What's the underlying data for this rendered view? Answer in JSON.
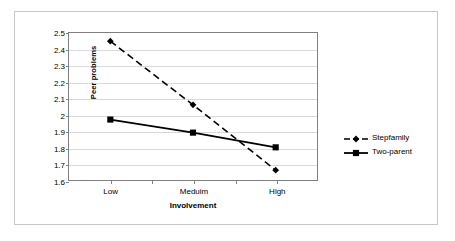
{
  "chart_data": {
    "type": "line",
    "title": "",
    "xlabel": "Involvement",
    "ylabel": "Peer problems",
    "categories": [
      "Low",
      "Meduim",
      "High"
    ],
    "ylim": [
      1.6,
      2.5
    ],
    "y_ticks": [
      "2.5",
      "2.4",
      "2.3",
      "2.2",
      "2.1",
      "2",
      "1.9",
      "1.8",
      "1.7",
      "1.6"
    ],
    "y_tick_values": [
      2.5,
      2.4,
      2.3,
      2.2,
      2.1,
      2.0,
      1.9,
      1.8,
      1.7,
      1.6
    ],
    "grid": true,
    "legend_position": "right",
    "series": [
      {
        "name": "Stepfamily",
        "values": [
          2.45,
          2.06,
          1.66
        ],
        "marker": "diamond",
        "line_style": "dashed",
        "color": "#000000"
      },
      {
        "name": "Two-parent",
        "values": [
          1.97,
          1.89,
          1.8
        ],
        "marker": "square",
        "line_style": "solid",
        "color": "#000000"
      }
    ]
  },
  "legend": {
    "items": [
      {
        "label": "Stepfamily",
        "marker": "diamond-marker-icon",
        "line_style": "dashed"
      },
      {
        "label": "Two-parent",
        "marker": "square-marker-icon",
        "line_style": "solid"
      }
    ]
  },
  "colors": {
    "series": "#000000",
    "gridline": "#d9d9d9",
    "axis": "#808080",
    "frame": "#c8c8c8",
    "background": "#ffffff"
  }
}
